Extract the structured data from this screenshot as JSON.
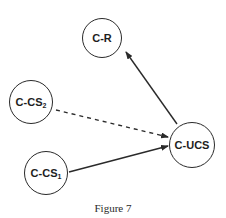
{
  "diagram": {
    "caption": "Figure 7",
    "nodes": [
      {
        "id": "C-R",
        "label": "C-R",
        "sub": "",
        "cx": 102,
        "cy": 38,
        "r": 20
      },
      {
        "id": "C-CS2",
        "label": "C-CS",
        "sub": "2",
        "cx": 31,
        "cy": 102,
        "r": 22
      },
      {
        "id": "C-CS1",
        "label": "C-CS",
        "sub": "1",
        "cx": 46,
        "cy": 173,
        "r": 22
      },
      {
        "id": "C-UCS",
        "label": "C-UCS",
        "sub": "",
        "cx": 192,
        "cy": 145,
        "r": 23
      }
    ],
    "edges": [
      {
        "from": "C-UCS",
        "to": "C-R",
        "style": "solid"
      },
      {
        "from": "C-CS2",
        "to": "C-UCS",
        "style": "dashed"
      },
      {
        "from": "C-CS1",
        "to": "C-UCS",
        "style": "solid"
      }
    ],
    "colors": {
      "stroke": "#2a2a2a",
      "background": "#ffffff"
    }
  }
}
